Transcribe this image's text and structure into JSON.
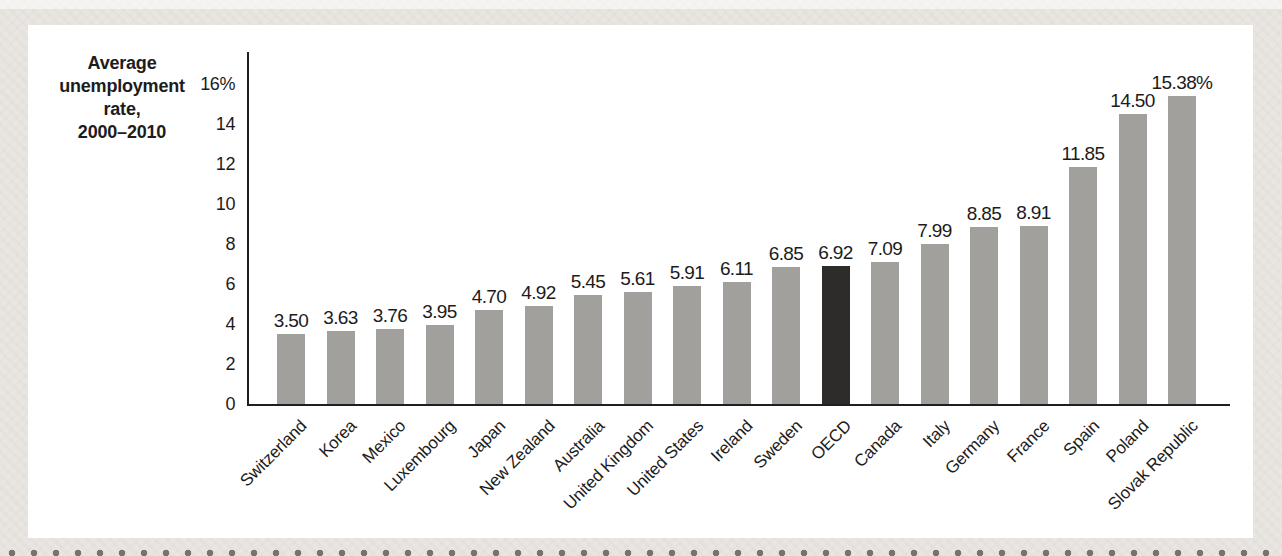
{
  "page": {
    "background_color": "#e9e6e1",
    "panel_color": "#ffffff"
  },
  "chart_data": {
    "type": "bar",
    "title_lines": [
      "Average",
      "unemployment",
      "rate,",
      "2000–2010"
    ],
    "categories": [
      "Switzerland",
      "Korea",
      "Mexico",
      "Luxembourg",
      "Japan",
      "New Zealand",
      "Australia",
      "United Kingdom",
      "United States",
      "Ireland",
      "Sweden",
      "OECD",
      "Canada",
      "Italy",
      "Germany",
      "France",
      "Spain",
      "Poland",
      "Slovak Republic"
    ],
    "values": [
      3.5,
      3.63,
      3.76,
      3.95,
      4.7,
      4.92,
      5.45,
      5.61,
      5.91,
      6.11,
      6.85,
      6.92,
      7.09,
      7.99,
      8.85,
      8.91,
      11.85,
      14.5,
      15.38
    ],
    "value_labels": [
      "3.50",
      "3.63",
      "3.76",
      "3.95",
      "4.70",
      "4.92",
      "5.45",
      "5.61",
      "5.91",
      "6.11",
      "6.85",
      "6.92",
      "7.09",
      "7.99",
      "8.85",
      "8.91",
      "11.85",
      "14.50",
      "15.38%"
    ],
    "highlight_category": "OECD",
    "highlight_index": 11,
    "xlabel": "",
    "ylabel": "",
    "ylim": [
      0,
      16
    ],
    "ytick_values": [
      0,
      2,
      4,
      6,
      8,
      10,
      12,
      14,
      16
    ],
    "ytick_labels": [
      "0",
      "2",
      "4",
      "6",
      "8",
      "10",
      "12",
      "14",
      "16%"
    ],
    "grid": false,
    "legend": false,
    "bar_color": "#a1a09d",
    "highlight_color": "#2e2c2b",
    "axis_color": "#1f1f1f"
  }
}
